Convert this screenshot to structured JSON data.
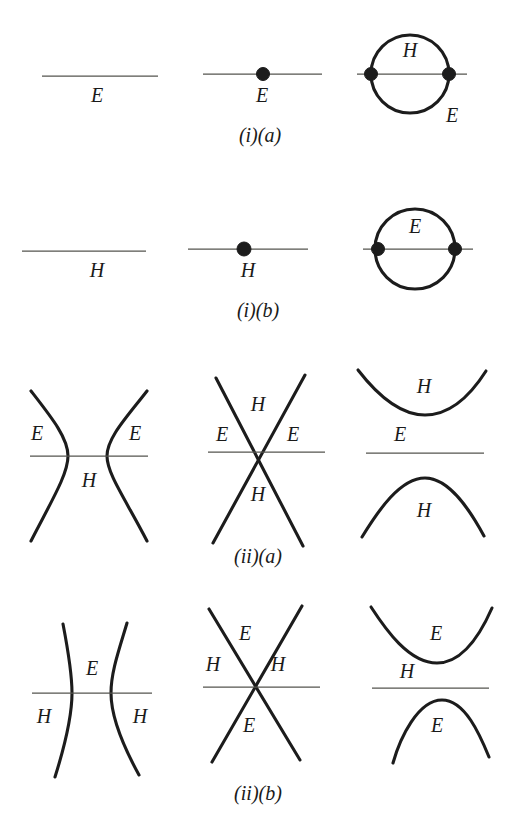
{
  "figure": {
    "background_color": "#ffffff",
    "ink_color": "#1c1c1c",
    "axis_color": "#55544f",
    "width": 519,
    "height": 840,
    "symbols": {
      "elliptic": "E",
      "hyperbolic": "H"
    }
  },
  "rows": [
    {
      "id": "row-i-a",
      "caption": "(i)(a)",
      "caption_x": 260,
      "caption_y": 137,
      "panels": [
        {
          "id": "i-a-1",
          "kind": "plain-line",
          "labels": [
            {
              "text": "E",
              "x": 97,
              "y": 97
            }
          ]
        },
        {
          "id": "i-a-2",
          "kind": "line-with-node",
          "labels": [
            {
              "text": "E",
              "x": 262,
              "y": 97
            }
          ]
        },
        {
          "id": "i-a-3",
          "kind": "circle-two-nodes",
          "labels": [
            {
              "text": "H",
              "x": 410,
              "y": 52
            },
            {
              "text": "E",
              "x": 452,
              "y": 117
            }
          ]
        }
      ]
    },
    {
      "id": "row-i-b",
      "caption": "(i)(b)",
      "caption_x": 258,
      "caption_y": 312,
      "panels": [
        {
          "id": "i-b-1",
          "kind": "plain-line",
          "labels": [
            {
              "text": "H",
              "x": 97,
              "y": 272
            }
          ]
        },
        {
          "id": "i-b-2",
          "kind": "line-with-node",
          "labels": [
            {
              "text": "H",
              "x": 248,
              "y": 272
            }
          ]
        },
        {
          "id": "i-b-3",
          "kind": "circle-two-nodes",
          "labels": [
            {
              "text": "E",
              "x": 415,
              "y": 228
            }
          ]
        }
      ]
    },
    {
      "id": "row-ii-a",
      "caption": "(ii)(a)",
      "caption_x": 258,
      "caption_y": 558,
      "panels": [
        {
          "id": "ii-a-1",
          "kind": "hyperbola-horizontal",
          "labels": [
            {
              "text": "E",
              "x": 37,
              "y": 435
            },
            {
              "text": "E",
              "x": 135,
              "y": 435
            },
            {
              "text": "H",
              "x": 89,
              "y": 482
            }
          ]
        },
        {
          "id": "ii-a-2",
          "kind": "crossing-lines",
          "labels": [
            {
              "text": "H",
              "x": 258,
              "y": 406
            },
            {
              "text": "E",
              "x": 222,
              "y": 436
            },
            {
              "text": "E",
              "x": 293,
              "y": 436
            },
            {
              "text": "H",
              "x": 258,
              "y": 496
            }
          ]
        },
        {
          "id": "ii-a-3",
          "kind": "hyperbola-vertical",
          "labels": [
            {
              "text": "H",
              "x": 424,
              "y": 388
            },
            {
              "text": "E",
              "x": 400,
              "y": 436
            },
            {
              "text": "H",
              "x": 424,
              "y": 512
            }
          ]
        }
      ]
    },
    {
      "id": "row-ii-b",
      "caption": "(ii)(b)",
      "caption_x": 258,
      "caption_y": 795,
      "panels": [
        {
          "id": "ii-b-1",
          "kind": "hyperbola-horizontal",
          "labels": [
            {
              "text": "E",
              "x": 92,
              "y": 670
            },
            {
              "text": "H",
              "x": 44,
              "y": 718
            },
            {
              "text": "H",
              "x": 140,
              "y": 718
            }
          ]
        },
        {
          "id": "ii-b-2",
          "kind": "crossing-lines",
          "labels": [
            {
              "text": "E",
              "x": 245,
              "y": 635
            },
            {
              "text": "H",
              "x": 213,
              "y": 666
            },
            {
              "text": "H",
              "x": 278,
              "y": 666
            },
            {
              "text": "E",
              "x": 249,
              "y": 727
            }
          ]
        },
        {
          "id": "ii-b-3",
          "kind": "hyperbola-vertical",
          "labels": [
            {
              "text": "E",
              "x": 436,
              "y": 635
            },
            {
              "text": "H",
              "x": 407,
              "y": 673
            },
            {
              "text": "E",
              "x": 437,
              "y": 727
            }
          ]
        }
      ]
    }
  ],
  "geometry": {
    "row_i_a": {
      "line1": {
        "x1": 42,
        "y1": 76,
        "x2": 158,
        "y2": 76
      },
      "line2": {
        "x1": 203,
        "y1": 74,
        "x2": 322,
        "y2": 74
      },
      "node2": {
        "cx": 263,
        "cy": 74,
        "r": 6.5
      },
      "circle": {
        "cx": 410,
        "cy": 74,
        "r": 39
      },
      "line3": {
        "x1": 357,
        "y1": 74,
        "x2": 467,
        "y2": 74
      },
      "node3a": {
        "cx": 371,
        "cy": 74,
        "r": 6.5
      },
      "node3b": {
        "cx": 449,
        "cy": 74,
        "r": 6.5
      }
    },
    "row_i_b": {
      "line1": {
        "x1": 22,
        "y1": 251,
        "x2": 146,
        "y2": 251
      },
      "line2": {
        "x1": 188,
        "y1": 249,
        "x2": 308,
        "y2": 249
      },
      "node2": {
        "cx": 244,
        "cy": 249,
        "r": 7
      },
      "circle": {
        "cx": 415,
        "cy": 249,
        "r": 40
      },
      "line3": {
        "x1": 363,
        "y1": 249,
        "x2": 473,
        "y2": 249
      },
      "node3a": {
        "cx": 378,
        "cy": 249,
        "r": 6.5
      },
      "node3b": {
        "cx": 455,
        "cy": 249,
        "r": 6.5
      }
    },
    "row_ii_a": {
      "axis1": {
        "x1": 30,
        "y1": 456,
        "x2": 148,
        "y2": 456
      },
      "hyp_left_vertex_x": 68,
      "hyp_right_vertex_x": 107,
      "axis2": {
        "x1": 208,
        "y1": 452,
        "x2": 325,
        "y2": 452
      },
      "cross_center": {
        "x": 259,
        "y": 452
      },
      "axis3": {
        "x1": 366,
        "y1": 453,
        "x2": 484,
        "y2": 453
      },
      "vert_top_vertex_y": 415,
      "vert_bottom_vertex_y": 478
    },
    "row_ii_b": {
      "axis1": {
        "x1": 32,
        "y1": 693,
        "x2": 152,
        "y2": 693
      },
      "hyp_left_vertex_x": 72,
      "hyp_right_vertex_x": 111,
      "axis2": {
        "x1": 203,
        "y1": 687,
        "x2": 320,
        "y2": 687
      },
      "cross_center": {
        "x": 256,
        "y": 687
      },
      "axis3": {
        "x1": 372,
        "y1": 688,
        "x2": 489,
        "y2": 688
      },
      "vert_top_vertex_y": 663,
      "vert_bottom_vertex_y": 700
    }
  }
}
